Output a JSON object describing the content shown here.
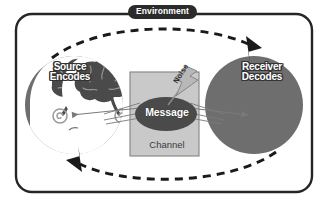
{
  "diagram": {
    "environment": {
      "label": "Environment"
    },
    "source": {
      "line1": "Source",
      "line2": "Encodes"
    },
    "receiver": {
      "line1": "Receiver",
      "line2": "Decodes"
    },
    "channel": {
      "label": "Channel"
    },
    "message": {
      "label": "Message"
    },
    "noise": {
      "label": "Noise"
    },
    "colors": {
      "border": "#262626",
      "badge_bg": "#2b2b2b",
      "badge_text": "#ffffff",
      "head_circle": "#6e6e6e",
      "head_silhouette": "#ffffff",
      "brain": "#4a4a4a",
      "channel_box": "#c9c9c9",
      "channel_border": "#7d7d7d",
      "message_ellipse": "#4a4a4a",
      "message_text": "#ffffff",
      "feedback_arc": "#1a1a1a",
      "signal_arrow": "#7a7a7a",
      "noise_bolt": "#b0b0b0",
      "background": "#ffffff"
    }
  }
}
